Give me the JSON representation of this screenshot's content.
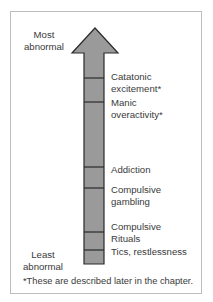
{
  "diagram": {
    "type": "severity-scale-arrow",
    "top_label": "Most\nabnormal",
    "top_label_lines": [
      "Most",
      "abnormal"
    ],
    "bottom_label_lines": [
      "Least",
      "abnormal"
    ],
    "arrow_fill": "#9a9a9a",
    "arrow_stroke": "#2a2a2a",
    "levels": [
      {
        "lines": [
          "Catatonic",
          "excitement*"
        ]
      },
      {
        "lines": [
          "Manic",
          "overactivity*"
        ]
      },
      {
        "lines": [
          "Addiction"
        ]
      },
      {
        "lines": [
          "Compulsive",
          "gambling"
        ]
      },
      {
        "lines": [
          "Compulsive",
          "Rituals"
        ]
      },
      {
        "lines": [
          "Tics, restlessness"
        ]
      }
    ],
    "footnote": "*These are described later in the chapter."
  }
}
